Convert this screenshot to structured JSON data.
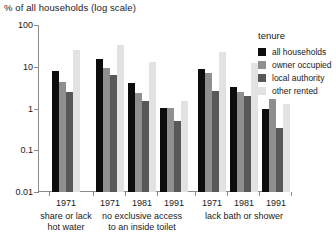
{
  "chart_data": {
    "type": "bar",
    "title": "",
    "ylabel": "% of all households (log scale)",
    "xlabel": "",
    "scale": "log",
    "ylim": [
      0.01,
      100
    ],
    "yticks": [
      100,
      10,
      1,
      0.1,
      0.01
    ],
    "ytick_labels": [
      "100",
      "10",
      "1",
      "0.1",
      "0.01"
    ],
    "grid": false,
    "legend_position": "right",
    "legend_title": "tenure",
    "series": [
      {
        "name": "all households",
        "color": "#0d0d0d",
        "values": [
          8.0,
          15.0,
          4.0,
          1.05,
          9.0,
          3.3,
          1.0
        ]
      },
      {
        "name": "owner occupied",
        "color": "#8f8f8f",
        "values": [
          4.3,
          9.5,
          2.3,
          1.05,
          7.0,
          2.5,
          1.7
        ]
      },
      {
        "name": "local authority",
        "color": "#585858",
        "values": [
          2.5,
          6.5,
          1.5,
          0.5,
          2.6,
          2.0,
          0.35
        ]
      },
      {
        "name": "other rented",
        "color": "#e2e2e2",
        "values": [
          25.0,
          33.0,
          13.0,
          1.5,
          22.0,
          12.0,
          1.3
        ]
      }
    ],
    "groups": [
      {
        "caption_line1": "share or lack",
        "caption_line2": "hot water",
        "years": [
          "1971"
        ]
      },
      {
        "caption_line1": "no exclusive access",
        "caption_line2": "to an inside toilet",
        "years": [
          "1971",
          "1981",
          "1991"
        ]
      },
      {
        "caption_line1": "lack bath or shower",
        "caption_line2": "",
        "years": [
          "1971",
          "1981",
          "1991"
        ]
      }
    ],
    "x_order": [
      {
        "group": 0,
        "year": "1971"
      },
      {
        "group": 1,
        "year": "1971"
      },
      {
        "group": 1,
        "year": "1981"
      },
      {
        "group": 1,
        "year": "1991"
      },
      {
        "group": 2,
        "year": "1971"
      },
      {
        "group": 2,
        "year": "1981"
      },
      {
        "group": 2,
        "year": "1991"
      }
    ]
  },
  "footnote": ""
}
